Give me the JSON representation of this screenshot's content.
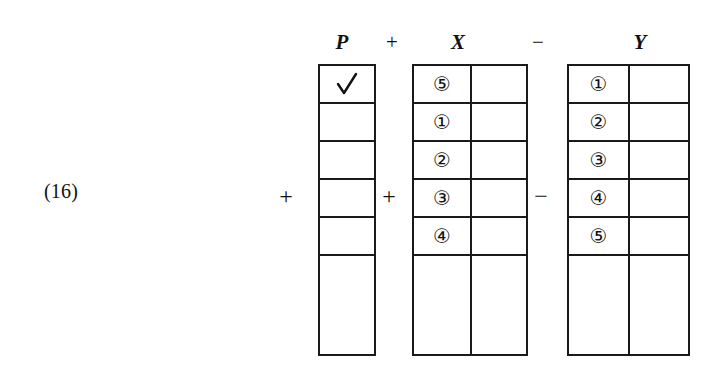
{
  "equation": {
    "number": "(16)"
  },
  "header": {
    "p_label": "P",
    "op1": "+",
    "x_label": "X",
    "op2": "−",
    "y_label": "Y"
  },
  "operators": {
    "before_p": "+",
    "p_to_x": "+",
    "x_to_y": "−"
  },
  "tables": {
    "p": {
      "name": "P",
      "columns": 1,
      "rows": 5,
      "cells": [
        [
          "✓"
        ],
        [
          ""
        ],
        [
          ""
        ],
        [
          ""
        ],
        [
          ""
        ]
      ],
      "has_tail": true
    },
    "x": {
      "name": "X",
      "columns": 2,
      "rows": 5,
      "cells": [
        [
          "⑤",
          ""
        ],
        [
          "①",
          ""
        ],
        [
          "②",
          ""
        ],
        [
          "③",
          ""
        ],
        [
          "④",
          ""
        ]
      ],
      "has_tail": true
    },
    "y": {
      "name": "Y",
      "columns": 2,
      "rows": 5,
      "cells": [
        [
          "①",
          ""
        ],
        [
          "②",
          ""
        ],
        [
          "③",
          ""
        ],
        [
          "④",
          ""
        ],
        [
          "⑤",
          ""
        ]
      ],
      "has_tail": true
    }
  },
  "colors": {
    "ink": "#1a1a1a",
    "paper": "#ffffff"
  }
}
